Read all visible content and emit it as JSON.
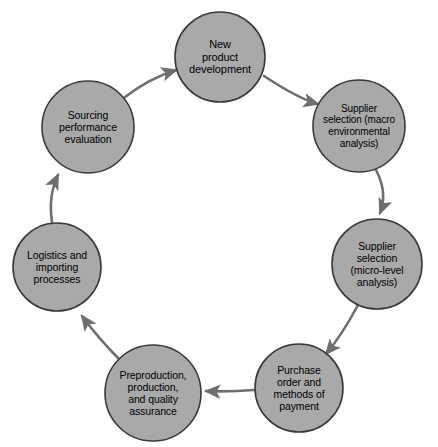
{
  "diagram": {
    "type": "cycle-diagram",
    "direction": "clockwise",
    "background_color": "#ffffff",
    "node_fill_color": "#a9a9a9",
    "node_stroke_color": "#3a3a3a",
    "arrow_color": "#6e6e6e",
    "label_color": "#000000",
    "nodes": [
      {
        "id": "new-product-development",
        "label": "New\nproduct\ndevelopment",
        "cx": 220,
        "cy": 57,
        "r": 45,
        "font_size": 11
      },
      {
        "id": "supplier-selection-macro",
        "label": "Supplier\nselection (macro\nenvironmental\nanalysis)",
        "cx": 359,
        "cy": 126,
        "r": 46,
        "font_size": 10
      },
      {
        "id": "supplier-selection-micro",
        "label": "Supplier\nselection\n(micro-level\nanalysis)",
        "cx": 377,
        "cy": 264,
        "r": 45,
        "font_size": 10.5
      },
      {
        "id": "purchase-order-methods-of-payment",
        "label": "Purchase\norder and\nmethods of\npayment",
        "cx": 299,
        "cy": 388,
        "r": 44,
        "font_size": 10.5
      },
      {
        "id": "preproduction-production-quality-assurance",
        "label": "Preproduction,\nproduction,\nand quality\nassurance",
        "cx": 153,
        "cy": 393,
        "r": 48,
        "font_size": 10.5
      },
      {
        "id": "logistics-and-importing-processes",
        "label": "Logistics and\nimporting\nprocesses",
        "cx": 57,
        "cy": 267,
        "r": 44,
        "font_size": 10.5
      },
      {
        "id": "sourcing-performance-evaluation",
        "label": "Sourcing\nperformance\nevaluation",
        "cx": 88,
        "cy": 127,
        "r": 46,
        "font_size": 10.5
      }
    ],
    "arrows": [
      {
        "id": "arrow-new-product-to-macro",
        "from": "new-product-development",
        "to": "supplier-selection-macro",
        "path": "M 264 76 Q 299 99 318 104"
      },
      {
        "id": "arrow-macro-to-micro",
        "from": "supplier-selection-macro",
        "to": "supplier-selection-micro",
        "path": "M 376 170 Q 388 193 380 213"
      },
      {
        "id": "arrow-micro-to-purchase-order",
        "from": "supplier-selection-micro",
        "to": "purchase-order-methods-of-payment",
        "path": "M 358 305 Q 342 335 326 354"
      },
      {
        "id": "arrow-purchase-order-to-preproduction",
        "from": "purchase-order-methods-of-payment",
        "to": "preproduction-production-quality-assurance",
        "path": "M 254 390 Q 228 392 206 391"
      },
      {
        "id": "arrow-preproduction-to-logistics",
        "from": "preproduction-production-quality-assurance",
        "to": "logistics-and-importing-processes",
        "path": "M 120 360 Q 98 338 82 316"
      },
      {
        "id": "arrow-logistics-to-sourcing",
        "from": "logistics-and-importing-processes",
        "to": "sourcing-performance-evaluation",
        "path": "M 52 222 Q 48 196 58 175"
      },
      {
        "id": "arrow-sourcing-to-new-product",
        "from": "sourcing-performance-evaluation",
        "to": "new-product-development",
        "path": "M 125 97 Q 150 78 176 70"
      }
    ]
  }
}
